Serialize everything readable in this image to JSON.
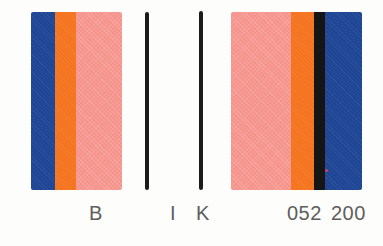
{
  "canvas": {
    "background": "#fdfdfc"
  },
  "palette": {
    "blue": "#1e4695",
    "orange": "#f4741f",
    "pink": "#f5938b",
    "rule_black": "#1b1b1b",
    "label_gray": "#5d5d5d"
  },
  "left_block": {
    "stripes": [
      {
        "name": "blue",
        "color": "#1e4695",
        "width": 24
      },
      {
        "name": "orange",
        "color": "#f4741f",
        "width": 21
      },
      {
        "name": "pink",
        "color": "#f5938b",
        "width": 46
      }
    ]
  },
  "rules": {
    "i_color": "#1b1b1b",
    "k_color": "#1b1b1b"
  },
  "right_block": {
    "stripes": [
      {
        "name": "pink",
        "color": "#f5938b",
        "width": 60
      },
      {
        "name": "orange",
        "color": "#f4741f",
        "width": 23
      },
      {
        "name": "black",
        "color": "#151515",
        "width": 11
      },
      {
        "name": "blue",
        "color": "#1e4695",
        "width": 37
      }
    ],
    "dot_color": "#cb4273"
  },
  "labels": {
    "b": "B",
    "i": "I",
    "k": "K",
    "code": "052 200"
  }
}
